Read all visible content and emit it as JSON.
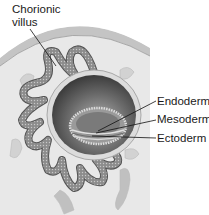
{
  "diagram": {
    "type": "anatomical-illustration",
    "labels": [
      {
        "id": "chorionic",
        "line1": "Chorionic",
        "line2": "villus"
      },
      {
        "id": "endoderm",
        "text": "Endoderm"
      },
      {
        "id": "mesoderm",
        "text": "Mesoderm"
      },
      {
        "id": "ectoderm",
        "text": "Ectoderm"
      }
    ],
    "colors": {
      "background": "#ffffff",
      "tissue_bg": "#e6e6e6",
      "outer_band": "#c8c8c8",
      "villus_fill": "#8a8a8a",
      "sphere_dark": "#5a5a5a",
      "leader_line": "#111111"
    }
  }
}
